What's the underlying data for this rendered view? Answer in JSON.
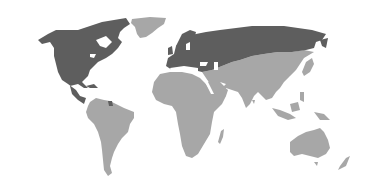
{
  "map": {
    "type": "world-choropleth",
    "colors": {
      "highlighted": "#5e5e5e",
      "other": "#a7a7a7",
      "background": "#ffffff"
    },
    "highlighted_regions": [
      "Canada",
      "United States",
      "Mexico",
      "Central America",
      "Europe",
      "Russia",
      "Ukraine",
      "Belarus",
      "Baltic states",
      "French Guiana",
      "Caribbean islands"
    ],
    "other_regions": [
      "Greenland",
      "South America",
      "Africa",
      "Middle East",
      "Central Asia",
      "South Asia",
      "China",
      "Mongolia",
      "Southeast Asia",
      "Japan",
      "Korea",
      "Indonesia",
      "Australia",
      "New Zealand",
      "Papua New Guinea",
      "Madagascar"
    ]
  }
}
